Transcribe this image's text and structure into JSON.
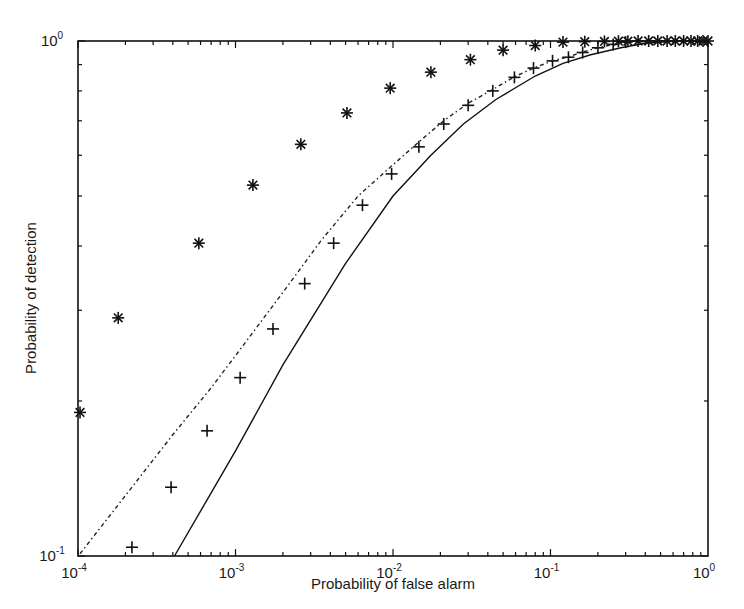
{
  "chart_data": {
    "type": "line",
    "title": "",
    "xlabel": "Probability of false alarm",
    "ylabel": "Probability of detection",
    "xscale": "log",
    "yscale": "log",
    "xlim": [
      0.0001,
      1
    ],
    "ylim": [
      0.1,
      1
    ],
    "grid": false,
    "legend": null,
    "x_ticks": [
      {
        "value": 0.0001,
        "base": "10",
        "exp": "-4"
      },
      {
        "value": 0.001,
        "base": "10",
        "exp": "-3"
      },
      {
        "value": 0.01,
        "base": "10",
        "exp": "-2"
      },
      {
        "value": 0.1,
        "base": "10",
        "exp": "-1"
      },
      {
        "value": 1,
        "base": "10",
        "exp": "0"
      }
    ],
    "y_ticks": [
      {
        "value": 0.1,
        "base": "10",
        "exp": "-1"
      },
      {
        "value": 1,
        "base": "10",
        "exp": "0"
      }
    ],
    "series": [
      {
        "name": "star markers",
        "style": "markers",
        "marker": "asterisk",
        "color": "#111111",
        "x": [
          0.000103,
          0.00018,
          0.000585,
          0.00129,
          0.0026,
          0.0051,
          0.0096,
          0.0174,
          0.031,
          0.05,
          0.08,
          0.12,
          0.165,
          0.22,
          0.27,
          0.31,
          0.36,
          0.42,
          0.48,
          0.55,
          0.62,
          0.7,
          0.78,
          0.86,
          0.93,
          1.0
        ],
        "y": [
          0.19,
          0.29,
          0.405,
          0.525,
          0.63,
          0.725,
          0.81,
          0.87,
          0.92,
          0.96,
          0.98,
          0.995,
          0.997,
          0.998,
          0.999,
          0.999,
          1.0,
          1.0,
          1.0,
          1.0,
          1.0,
          1.0,
          1.0,
          1.0,
          1.0,
          1.0
        ]
      },
      {
        "name": "plus markers",
        "style": "markers",
        "marker": "plus",
        "color": "#111111",
        "x": [
          0.00022,
          0.00039,
          0.00066,
          0.00107,
          0.00173,
          0.00275,
          0.0042,
          0.0064,
          0.0098,
          0.0146,
          0.021,
          0.03,
          0.043,
          0.059,
          0.078,
          0.103,
          0.13,
          0.16,
          0.2,
          0.25,
          0.3
        ],
        "y": [
          0.104,
          0.136,
          0.175,
          0.222,
          0.276,
          0.338,
          0.405,
          0.48,
          0.552,
          0.623,
          0.69,
          0.75,
          0.8,
          0.85,
          0.886,
          0.915,
          0.93,
          0.95,
          0.97,
          0.985,
          0.995
        ]
      },
      {
        "name": "dash-dot curve",
        "style": "dashdot",
        "color": "#222222",
        "x": [
          0.000103,
          0.0002,
          0.0004,
          0.0007,
          0.001,
          0.002,
          0.0035,
          0.006,
          0.01,
          0.0146,
          0.021,
          0.03,
          0.043,
          0.059,
          0.078,
          0.103,
          0.13,
          0.16,
          0.2,
          0.25,
          0.3,
          0.4,
          0.6,
          1.0
        ],
        "y": [
          0.101,
          0.131,
          0.172,
          0.212,
          0.245,
          0.325,
          0.41,
          0.5,
          0.575,
          0.637,
          0.7,
          0.757,
          0.805,
          0.852,
          0.886,
          0.915,
          0.932,
          0.952,
          0.97,
          0.985,
          0.993,
          0.998,
          1.0,
          1.0
        ]
      },
      {
        "name": "solid curve",
        "style": "solid",
        "color": "#111111",
        "x": [
          0.00041,
          0.001,
          0.002,
          0.005,
          0.01,
          0.0174,
          0.028,
          0.045,
          0.08,
          0.12,
          0.18,
          0.28,
          0.4,
          0.6,
          1.0
        ],
        "y": [
          0.1,
          0.16,
          0.235,
          0.37,
          0.5,
          0.6,
          0.69,
          0.77,
          0.855,
          0.905,
          0.94,
          0.97,
          0.99,
          0.998,
          1.0
        ]
      }
    ]
  }
}
